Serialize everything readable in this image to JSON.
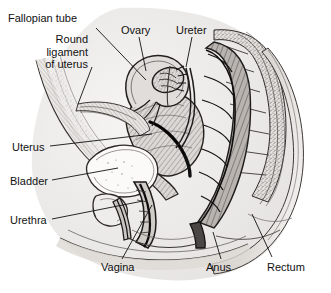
{
  "figure": {
    "type": "anatomical-illustration",
    "view": "midsagittal (side) section of the female pelvis",
    "style": "black-and-white engraved / stippled medical line art on white background",
    "background_color": "#ffffff",
    "ink_color": "#111111",
    "fill_grey": "#d9d9d9",
    "width": 331,
    "height": 293
  },
  "labels": [
    {
      "id": "fallopian-tube",
      "text": "Fallopian tube",
      "x": 8,
      "y": 12,
      "align": "left",
      "leader": "M 96 28 L 146 80"
    },
    {
      "id": "round-ligament-of-uterus",
      "text": "Round\nligament\nof uterus",
      "line1": "Round",
      "line2": "ligament",
      "line3": "of uterus",
      "x": 30,
      "y": 33,
      "align": "right",
      "leader": "M 92 67 L 78 104"
    },
    {
      "id": "ovary",
      "text": "Ovary",
      "x": 121,
      "y": 24,
      "align": "left",
      "leader": "M 139 37 L 146 71"
    },
    {
      "id": "ureter",
      "text": "Ureter",
      "x": 176,
      "y": 24,
      "align": "left",
      "leader": "M 192 37 L 186 67"
    },
    {
      "id": "uterus",
      "text": "Uterus",
      "x": 12,
      "y": 141,
      "align": "left",
      "leader": "M 50 146 L 152 134"
    },
    {
      "id": "bladder",
      "text": "Bladder",
      "x": 10,
      "y": 175,
      "align": "left",
      "leader": "M 52 180 L 118 168"
    },
    {
      "id": "urethra",
      "text": "Urethra",
      "x": 10,
      "y": 214,
      "align": "left",
      "leader": "M 52 219 L 143 201"
    },
    {
      "id": "vagina",
      "text": "Vagina",
      "x": 101,
      "y": 261,
      "align": "left",
      "leader": "M 122 259 L 152 205"
    },
    {
      "id": "anus",
      "text": "Anus",
      "x": 206,
      "y": 261,
      "align": "left",
      "leader": "M 221 259 L 213 232"
    },
    {
      "id": "rectum",
      "text": "Rectum",
      "x": 267,
      "y": 261,
      "align": "left",
      "leader": "M 272 257 L 252 214"
    }
  ]
}
